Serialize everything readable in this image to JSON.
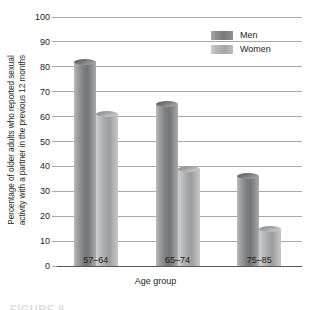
{
  "chart_data": {
    "type": "bar",
    "title": "",
    "xlabel": "Age group",
    "ylabel_line1": "Percentage of older adults who reported sexual",
    "ylabel_line2": "activity with a partner in the previous 12 months",
    "categories": [
      "57–64",
      "65–74",
      "75–85"
    ],
    "series": [
      {
        "name": "Men",
        "values": [
          82,
          65,
          36
        ],
        "color": "#7d7f81"
      },
      {
        "name": "Women",
        "values": [
          61,
          39,
          15
        ],
        "color": "#a5a7a9"
      }
    ],
    "ylim": [
      0,
      100
    ],
    "ytick_labels": [
      "0",
      "10",
      "20",
      "30",
      "40",
      "50",
      "60",
      "70",
      "80",
      "90",
      "100"
    ],
    "ytick_values": [
      0,
      10,
      20,
      30,
      40,
      50,
      60,
      70,
      80,
      90,
      100
    ],
    "grid": true,
    "legend_position": "top-right"
  },
  "legend": {
    "entries": [
      {
        "label": "Men"
      },
      {
        "label": "Women"
      }
    ]
  },
  "caption": {
    "clipped_text": "FIGURE 8"
  }
}
